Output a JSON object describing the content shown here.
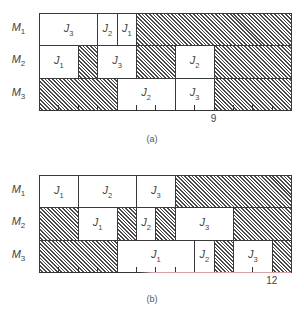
{
  "chart_data": [
    {
      "type": "gantt",
      "id": "a",
      "caption": "(a)",
      "time_units": 13,
      "axis_labels": [
        {
          "t": 9,
          "label": "9"
        }
      ],
      "rows": [
        {
          "machine": "M",
          "sub": "1",
          "blocks": [
            {
              "start": 0,
              "end": 3,
              "job": "J",
              "sub": "3"
            },
            {
              "start": 3,
              "end": 4,
              "job": "J",
              "sub": "2"
            },
            {
              "start": 4,
              "end": 5,
              "job": "J",
              "sub": "1"
            },
            {
              "start": 5,
              "end": 13,
              "idle": true
            }
          ]
        },
        {
          "machine": "M",
          "sub": "2",
          "blocks": [
            {
              "start": 0,
              "end": 2,
              "job": "J",
              "sub": "1"
            },
            {
              "start": 2,
              "end": 3,
              "idle": true
            },
            {
              "start": 3,
              "end": 5,
              "job": "J",
              "sub": "3"
            },
            {
              "start": 5,
              "end": 7,
              "idle": true
            },
            {
              "start": 7,
              "end": 9,
              "job": "J",
              "sub": "2"
            },
            {
              "start": 9,
              "end": 13,
              "idle": true
            }
          ]
        },
        {
          "machine": "M",
          "sub": "3",
          "blocks": [
            {
              "start": 0,
              "end": 4,
              "idle": true
            },
            {
              "start": 4,
              "end": 7,
              "job": "J",
              "sub": "2"
            },
            {
              "start": 7,
              "end": 9,
              "job": "J",
              "sub": "3"
            },
            {
              "start": 9,
              "end": 13,
              "idle": true
            }
          ]
        }
      ]
    },
    {
      "type": "gantt",
      "id": "b",
      "caption": "(b)",
      "time_units": 13,
      "axis_labels": [
        {
          "t": 12,
          "label": "12"
        }
      ],
      "rows": [
        {
          "machine": "M",
          "sub": "1",
          "blocks": [
            {
              "start": 0,
              "end": 2,
              "job": "J",
              "sub": "1"
            },
            {
              "start": 2,
              "end": 5,
              "job": "J",
              "sub": "2"
            },
            {
              "start": 5,
              "end": 7,
              "job": "J",
              "sub": "3"
            },
            {
              "start": 7,
              "end": 13,
              "idle": true
            }
          ]
        },
        {
          "machine": "M",
          "sub": "2",
          "blocks": [
            {
              "start": 0,
              "end": 2,
              "idle": true
            },
            {
              "start": 2,
              "end": 4,
              "job": "J",
              "sub": "1"
            },
            {
              "start": 4,
              "end": 5,
              "idle": true
            },
            {
              "start": 5,
              "end": 6,
              "job": "J",
              "sub": "2"
            },
            {
              "start": 6,
              "end": 7,
              "idle": true
            },
            {
              "start": 7,
              "end": 10,
              "job": "J",
              "sub": "3"
            },
            {
              "start": 10,
              "end": 13,
              "idle": true
            }
          ]
        },
        {
          "machine": "M",
          "sub": "3",
          "blocks": [
            {
              "start": 0,
              "end": 4,
              "idle": true
            },
            {
              "start": 4,
              "end": 8,
              "job": "J",
              "sub": "1"
            },
            {
              "start": 8,
              "end": 9,
              "job": "J",
              "sub": "2"
            },
            {
              "start": 9,
              "end": 10,
              "idle": true
            },
            {
              "start": 10,
              "end": 12,
              "job": "J",
              "sub": "3"
            },
            {
              "start": 12,
              "end": 13,
              "idle": true
            }
          ]
        }
      ]
    }
  ],
  "layout": {
    "unit_px": 19.4,
    "row_height": 32.3,
    "charts_top": [
      13,
      175
    ],
    "captions_y": [
      134,
      294
    ]
  }
}
